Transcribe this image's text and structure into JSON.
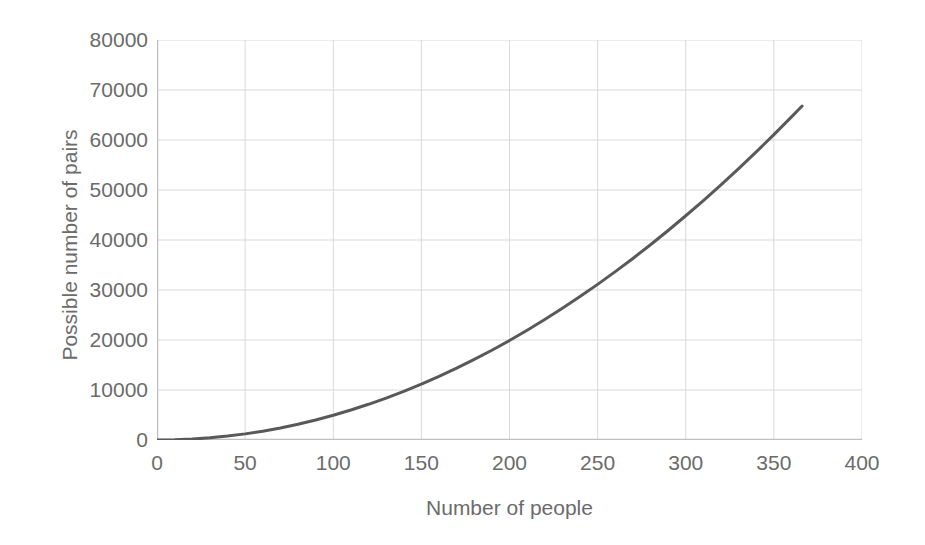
{
  "chart_data": {
    "type": "line",
    "title": "",
    "xlabel": "Number of people",
    "ylabel": "Possible number of pairs",
    "xlim": [
      0,
      400
    ],
    "ylim": [
      0,
      80000
    ],
    "xticks": [
      0,
      50,
      100,
      150,
      200,
      250,
      300,
      350,
      400
    ],
    "xtick_labels": [
      "0",
      "50",
      "100",
      "150",
      "200",
      "250",
      "300",
      "350",
      "400"
    ],
    "yticks": [
      0,
      10000,
      20000,
      30000,
      40000,
      50000,
      60000,
      70000,
      80000
    ],
    "ytick_labels": [
      "0",
      "10000",
      "20000",
      "30000",
      "40000",
      "50000",
      "60000",
      "70000",
      "80000"
    ],
    "grid": true,
    "grid_color": "#d9d9d9",
    "legend": null,
    "legend_position": "none",
    "series": [
      {
        "name": "Possible number of pairs",
        "color": "#595959",
        "line_width": 3,
        "x": [
          0,
          10,
          20,
          30,
          40,
          50,
          60,
          70,
          80,
          90,
          100,
          110,
          120,
          130,
          140,
          150,
          160,
          170,
          180,
          190,
          200,
          210,
          220,
          230,
          240,
          250,
          260,
          270,
          280,
          290,
          300,
          310,
          320,
          330,
          340,
          350,
          360,
          366
        ],
        "values": [
          0,
          45,
          190,
          435,
          780,
          1225,
          1770,
          2415,
          3160,
          4005,
          4950,
          5995,
          7140,
          8385,
          9730,
          11175,
          12720,
          14365,
          16110,
          17955,
          19900,
          21945,
          24090,
          26335,
          28680,
          31125,
          33670,
          36315,
          39060,
          41905,
          44850,
          47895,
          51040,
          54285,
          57630,
          61075,
          64620,
          66795
        ]
      }
    ]
  },
  "axes": {
    "x_title": "Number of people",
    "y_title": "Possible number of pairs"
  }
}
